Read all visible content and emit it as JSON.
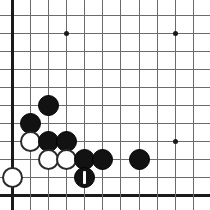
{
  "board": {
    "title": "Go board corner position",
    "size_px": 210,
    "grid": {
      "x_positions": [
        12,
        30,
        48,
        66,
        84,
        102,
        120,
        139,
        157,
        175,
        193
      ],
      "y_positions": [
        15,
        33,
        51,
        69,
        87,
        105,
        123,
        141,
        159,
        177,
        195
      ],
      "left_edge_index": 0,
      "bottom_edge_index": 10,
      "line_color": "#6b6b6b",
      "edge_color": "#1a1a1a",
      "background_color": "#ffffff"
    },
    "star_points": [
      {
        "col": 3,
        "row": 1,
        "name": "star-point-upper-left"
      },
      {
        "col": 9,
        "row": 1,
        "name": "star-point-upper-right"
      },
      {
        "col": 9,
        "row": 7,
        "name": "star-point-lower-right"
      }
    ],
    "stone_colors": {
      "black": "#121212",
      "white": "#ffffff",
      "white_outline": "#2a2a2a"
    },
    "stone_diameter_px": 21,
    "stones": [
      {
        "col": 2,
        "row": 5,
        "color": "black",
        "name": "stone-black-c2r5",
        "marked": false
      },
      {
        "col": 1,
        "row": 6,
        "color": "black",
        "name": "stone-black-c1r6",
        "marked": false
      },
      {
        "col": 1,
        "row": 7,
        "color": "white",
        "name": "stone-white-c1r7",
        "marked": false
      },
      {
        "col": 2,
        "row": 7,
        "color": "black",
        "name": "stone-black-c2r7",
        "marked": false
      },
      {
        "col": 3,
        "row": 7,
        "color": "black",
        "name": "stone-black-c3r7",
        "marked": false
      },
      {
        "col": 2,
        "row": 8,
        "color": "white",
        "name": "stone-white-c2r8",
        "marked": false
      },
      {
        "col": 3,
        "row": 8,
        "color": "white",
        "name": "stone-white-c3r8",
        "marked": false
      },
      {
        "col": 4,
        "row": 8,
        "color": "black",
        "name": "stone-black-c4r8",
        "marked": false
      },
      {
        "col": 5,
        "row": 8,
        "color": "black",
        "name": "stone-black-c5r8",
        "marked": false
      },
      {
        "col": 7,
        "row": 8,
        "color": "black",
        "name": "stone-black-c7r8",
        "marked": false
      },
      {
        "col": 0,
        "row": 9,
        "color": "white",
        "name": "stone-white-c0r9",
        "marked": false
      },
      {
        "col": 4,
        "row": 9,
        "color": "black",
        "name": "stone-black-c4r9-last-move",
        "marked": true
      }
    ],
    "move_marker": {
      "label": "1",
      "color": "#ffffff",
      "width_px": 3,
      "height_px": 13,
      "on_stone": "stone-black-c4r9-last-move"
    }
  }
}
